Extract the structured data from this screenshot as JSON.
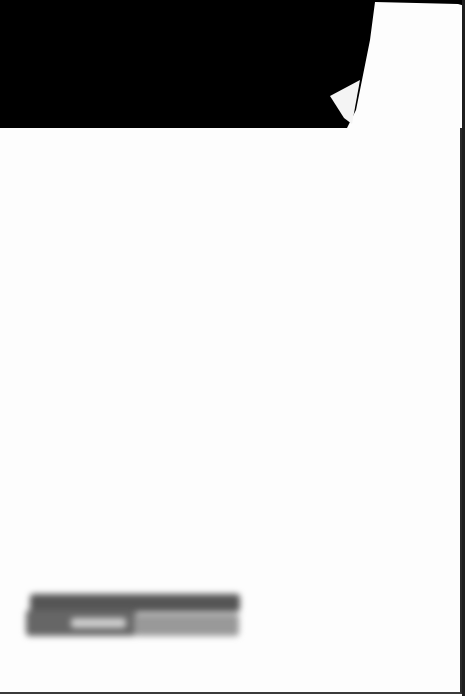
{
  "document": {
    "type": "scanned-page",
    "background_color": "#000000",
    "page_color": "#fdfdfd",
    "redacted_block": {
      "text": "",
      "legible": false
    }
  }
}
